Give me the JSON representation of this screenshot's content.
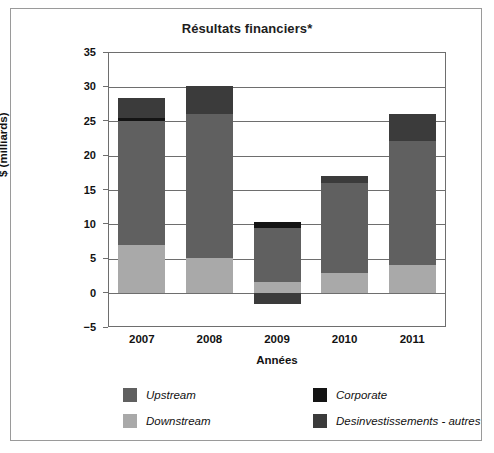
{
  "chart_data": {
    "type": "bar",
    "subtype": "stacked-bar",
    "title": "Résultats financiers*",
    "xlabel": "Années",
    "ylabel": "$ (milliards)",
    "categories": [
      "2007",
      "2008",
      "2009",
      "2010",
      "2011"
    ],
    "ylim": [
      -5,
      35
    ],
    "yticks": [
      -5,
      0,
      5,
      10,
      15,
      20,
      25,
      30,
      35
    ],
    "ytick_labels": [
      "−5",
      "0",
      "5",
      "10",
      "15",
      "20",
      "25",
      "30",
      "35"
    ],
    "grid": true,
    "legend_position": "bottom",
    "series": [
      {
        "name": "Downstream",
        "color": "#a9a9a9",
        "values": [
          7.0,
          5.0,
          1.6,
          2.9,
          4.0
        ]
      },
      {
        "name": "Upstream",
        "color": "#606060",
        "values": [
          18.0,
          21.0,
          7.8,
          13.1,
          18.0
        ]
      },
      {
        "name": "Corporate",
        "color": "#141414",
        "values": [
          0.4,
          0.0,
          0.9,
          0.0,
          0.0
        ]
      },
      {
        "name": "Desinvestissements - autres",
        "color": "#3b3b3b",
        "values": [
          2.9,
          4.0,
          -1.7,
          1.0,
          4.0
        ]
      }
    ],
    "totals": [
      28.3,
      30.0,
      10.3,
      17.0,
      26.0
    ],
    "annotations": []
  },
  "legend": {
    "items": [
      {
        "label": "Upstream",
        "color": "#606060"
      },
      {
        "label": "Corporate",
        "color": "#141414"
      },
      {
        "label": "Downstream",
        "color": "#a9a9a9"
      },
      {
        "label": "Desinvestissements - autres",
        "color": "#3b3b3b"
      }
    ]
  }
}
